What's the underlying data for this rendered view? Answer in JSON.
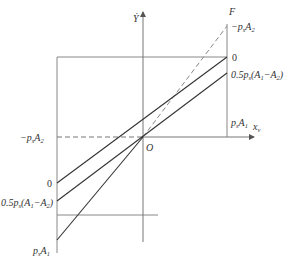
{
  "diagram": {
    "type": "force-vs-velocity line diagram",
    "axes": {
      "y_label": "Ẏ",
      "x_label": "x",
      "x_label_subscript": "v",
      "origin_label": "O",
      "right_axis_label": "F"
    },
    "right_labels": {
      "top_dashed": "−p",
      "top_dashed_sub": "s",
      "top_dashed_tail": "A",
      "top_dashed_tail_sub": "2",
      "zero": "0",
      "half": "0.5p",
      "half_sub": "s",
      "half_tail": "(A",
      "half_tail_sub1": "1",
      "half_mid": "−A",
      "half_tail_sub2": "2",
      "half_close": ")",
      "bottom": "p",
      "bottom_sub": "s",
      "bottom_tail": "A",
      "bottom_tail_sub": "1"
    },
    "left_labels": {
      "dashed": "−p",
      "dashed_sub": "s",
      "dashed_tail": "A",
      "dashed_tail_sub": "2",
      "zero": "0",
      "half": "0.5p",
      "half_sub": "s",
      "half_tail": "(A",
      "half_tail_sub1": "1",
      "half_mid": "−A",
      "half_tail_sub2": "2",
      "half_close": ")",
      "bottom": "p",
      "bottom_sub": "s",
      "bottom_tail": "A",
      "bottom_tail_sub": "1"
    },
    "colors": {
      "line": "#333333",
      "frame": "#888888",
      "dashed": "#777777"
    }
  }
}
